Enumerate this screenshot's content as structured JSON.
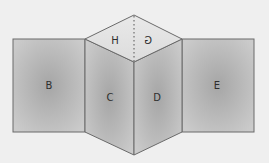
{
  "diagram": {
    "faces": [
      {
        "id": "B",
        "label": "B"
      },
      {
        "id": "C",
        "label": "C"
      },
      {
        "id": "D",
        "label": "D"
      },
      {
        "id": "E",
        "label": "E"
      },
      {
        "id": "H",
        "label": "H"
      },
      {
        "id": "G",
        "label": "G",
        "mirrored": true
      }
    ],
    "colors": {
      "background": "#efefef",
      "face_dark": "#a9a9a9",
      "face_light": "#cdcdcd",
      "top_face": "#e2e2e2",
      "edge": "#6a6a6a",
      "text": "#2e2e2e"
    }
  }
}
